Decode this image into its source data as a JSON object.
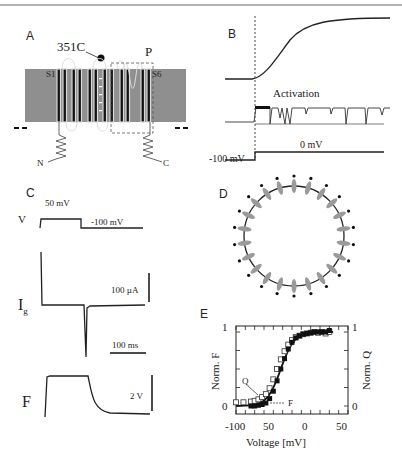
{
  "figure": {
    "border_color": "#666666",
    "membrane_color": "#8f8f8f",
    "helix_color": "#111111",
    "subunit_color": "#9a9a9a"
  },
  "panelA": {
    "label": "A",
    "residue_label": "351C",
    "pore_label": "P",
    "s1_label": "S1",
    "s6_label": "S6",
    "n_label": "N",
    "c_label": "C"
  },
  "panelB": {
    "label": "B",
    "activation_label": "Activation",
    "holding_label": "-100 mV",
    "step_label": "0 mV"
  },
  "panelC": {
    "label": "C",
    "v_label": "V",
    "ig_label": "I",
    "ig_sub": "g",
    "f_label": "F",
    "pulse_label": "50 mV",
    "holding_label": "-100 mV",
    "current_scale": "100 µA",
    "time_scale": "100 ms",
    "fluor_scale": "2 V"
  },
  "panelD": {
    "label": "D"
  },
  "panelE": {
    "label": "E",
    "left_axis_label": "Norm. F",
    "right_axis_label": "Norm. Q",
    "x_axis_label": "Voltage [mV]",
    "x_ticks": [
      "-100",
      "50",
      "0",
      "50"
    ],
    "left_ticks": [
      "0",
      "1"
    ],
    "right_ticks": [
      "0",
      "1"
    ],
    "q_annot": "Q",
    "f_annot": "F"
  },
  "chart_data": {
    "type": "scatter",
    "title": "",
    "xlabel": "Voltage [mV]",
    "ylabel": "Norm. F",
    "y2label": "Norm. Q",
    "xlim": [
      -100,
      50
    ],
    "ylim": [
      0,
      1
    ],
    "x_tick_labels": [
      "-100",
      "50",
      "0",
      "50"
    ],
    "series": [
      {
        "name": "Q",
        "marker": "open-square",
        "x": [
          -100,
          -90,
          -80,
          -75,
          -70,
          -65,
          -60,
          -55,
          -50,
          -45,
          -40,
          -35,
          -30,
          -25,
          -20,
          -15,
          -10,
          -5,
          0,
          5,
          10,
          15,
          20,
          25
        ],
        "y": [
          0.05,
          0.05,
          0.06,
          0.07,
          0.09,
          0.12,
          0.16,
          0.24,
          0.36,
          0.5,
          0.63,
          0.74,
          0.83,
          0.89,
          0.93,
          0.95,
          0.97,
          0.98,
          0.99,
          1.0,
          0.99,
          1.0,
          0.98,
          1.0
        ]
      },
      {
        "name": "F",
        "marker": "filled-square",
        "x": [
          -80,
          -75,
          -70,
          -65,
          -60,
          -55,
          -50,
          -45,
          -40,
          -35,
          -30,
          -25,
          -20,
          -15,
          -10,
          -5,
          0,
          5,
          10,
          15,
          20,
          25
        ],
        "y": [
          0.0,
          0.0,
          0.01,
          0.02,
          0.04,
          0.1,
          0.2,
          0.34,
          0.5,
          0.64,
          0.77,
          0.86,
          0.92,
          0.95,
          0.97,
          0.98,
          0.99,
          1.0,
          1.0,
          1.0,
          1.0,
          1.02
        ]
      }
    ]
  }
}
